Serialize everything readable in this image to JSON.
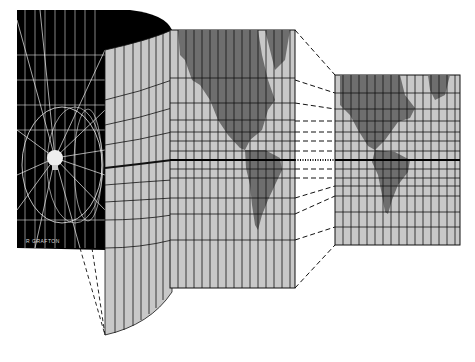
{
  "figure": {
    "signature": "R GRAFTON",
    "colors": {
      "background": "#ffffff",
      "cylinder_interior": "#000000",
      "map_ocean": "#c8c8c8",
      "map_land": "#6e6e6e",
      "grid_lines": "#1a1a1a",
      "equator": "#000000"
    },
    "panels": [
      {
        "name": "cylinder",
        "description": "Globe with light bulb at center projecting graticule onto surrounding cylinder"
      },
      {
        "name": "unrolled-map",
        "description": "Cylinder surface unrolled showing the Americas on graticule"
      },
      {
        "name": "mercator-map",
        "description": "Rescaled Mercator map of the Americas with equator line"
      }
    ]
  }
}
